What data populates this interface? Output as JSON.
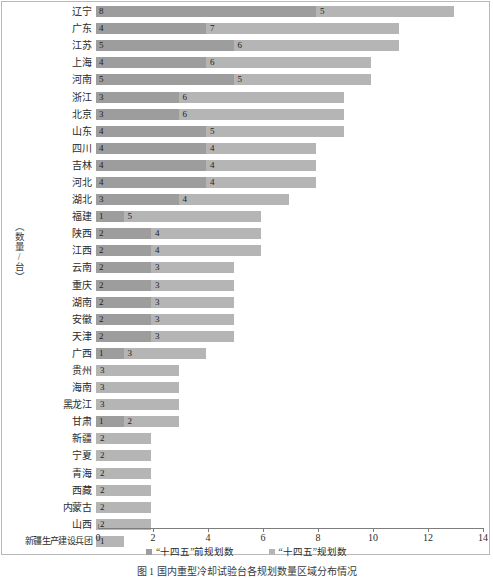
{
  "chart_data": {
    "type": "bar",
    "orientation": "horizontal",
    "stacked": true,
    "title": "",
    "xlabel": "",
    "ylabel": "（数量/台）",
    "xlim": [
      0,
      14
    ],
    "xticks": [
      0,
      2,
      4,
      6,
      8,
      10,
      12,
      14
    ],
    "grid": false,
    "legend_position": "bottom",
    "categories": [
      "辽宁",
      "广东",
      "江苏",
      "上海",
      "河南",
      "浙江",
      "北京",
      "山东",
      "四川",
      "吉林",
      "河北",
      "湖北",
      "福建",
      "陕西",
      "江西",
      "云南",
      "重庆",
      "湖南",
      "安徽",
      "天津",
      "广西",
      "贵州",
      "海南",
      "黑龙江",
      "甘肃",
      "新疆",
      "宁夏",
      "青海",
      "西藏",
      "内蒙古",
      "山西",
      "新疆生产建设兵团"
    ],
    "series": [
      {
        "name": "“十四五”前规划数",
        "color": "#9d9d9d",
        "values": [
          8,
          4,
          5,
          4,
          5,
          3,
          3,
          4,
          4,
          4,
          4,
          3,
          1,
          2,
          2,
          2,
          2,
          2,
          2,
          2,
          1,
          0,
          0,
          0,
          1,
          0,
          0,
          0,
          0,
          0,
          0,
          0
        ]
      },
      {
        "name": "“十四五”规划数",
        "color": "#b5b5b5",
        "values": [
          5,
          7,
          6,
          6,
          5,
          6,
          6,
          5,
          4,
          4,
          4,
          4,
          5,
          4,
          4,
          3,
          3,
          3,
          3,
          3,
          3,
          3,
          3,
          3,
          2,
          2,
          2,
          2,
          2,
          2,
          2,
          1
        ]
      }
    ],
    "totals": [
      13,
      11,
      11,
      10,
      10,
      9,
      9,
      9,
      8,
      8,
      8,
      7,
      6,
      6,
      6,
      5,
      5,
      5,
      5,
      5,
      4,
      3,
      3,
      3,
      3,
      2,
      2,
      2,
      2,
      2,
      2,
      1
    ]
  },
  "legend": {
    "items": [
      {
        "label": "“十四五”前规划数",
        "color": "#9d9d9d"
      },
      {
        "label": "“十四五”规划数",
        "color": "#b5b5b5"
      }
    ]
  },
  "axis": {
    "y_title": "（数量/台）",
    "x_tick_labels": [
      "0",
      "2",
      "4",
      "6",
      "8",
      "10",
      "12",
      "14"
    ]
  },
  "caption": "图 1   国内重型冷却试验台各规划数量区域分布情况"
}
